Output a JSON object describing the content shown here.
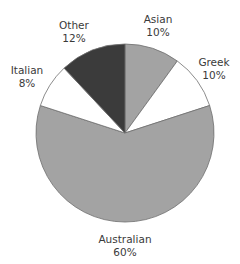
{
  "chart_data": {
    "type": "pie",
    "title": "",
    "start_angle_deg": 0,
    "direction": "clockwise",
    "center": [
      125,
      133
    ],
    "radius": 89,
    "slices": [
      {
        "label": "Asian",
        "value": 10,
        "value_label": "10%",
        "color": "#a3a3a3",
        "label_pos": [
          158,
          19
        ]
      },
      {
        "label": "Greek",
        "value": 10,
        "value_label": "10%",
        "color": "#ffffff",
        "label_pos": [
          214,
          62
        ]
      },
      {
        "label": "Australian",
        "value": 60,
        "value_label": "60%",
        "color": "#a3a3a3",
        "label_pos": [
          125,
          239
        ]
      },
      {
        "label": "Italian",
        "value": 8,
        "value_label": "8%",
        "color": "#ffffff",
        "label_pos": [
          27,
          70
        ]
      },
      {
        "label": "Other",
        "value": 12,
        "value_label": "12%",
        "color": "#3b3b3b",
        "label_pos": [
          74,
          25
        ]
      }
    ],
    "categories": [
      "Asian",
      "Greek",
      "Australian",
      "Italian",
      "Other"
    ],
    "values": [
      10,
      10,
      60,
      8,
      12
    ],
    "legend": "none (labels placed outside slices)",
    "outline_color": "#6e6e6e",
    "label_color": "#3a3a3a"
  }
}
